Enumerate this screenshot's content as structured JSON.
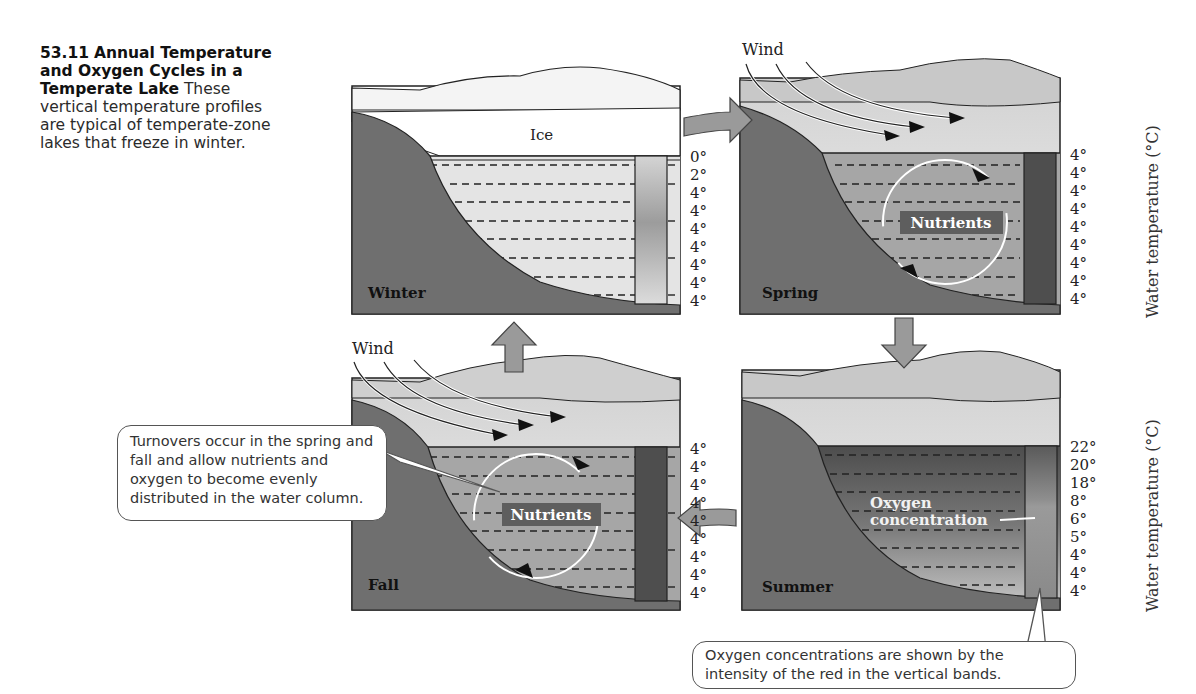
{
  "caption": {
    "figure_number": "53.11",
    "title": "Annual Temperature and Oxygen Cycles in a Temperate Lake",
    "body": "These vertical temperature profiles are typical of temperate-zone lakes that freeze in winter."
  },
  "panels": {
    "winter": {
      "label": "Winter",
      "surface_label": "Ice",
      "temperatures": [
        "0°",
        "2°",
        "4°",
        "4°",
        "4°",
        "4°",
        "4°",
        "4°",
        "4°"
      ]
    },
    "spring": {
      "label": "Spring",
      "wind_label": "Wind",
      "nutrients_label": "Nutrients",
      "temperatures": [
        "4°",
        "4°",
        "4°",
        "4°",
        "4°",
        "4°",
        "4°",
        "4°",
        "4°"
      ],
      "axis_label": "Water temperature (°C)"
    },
    "fall": {
      "label": "Fall",
      "wind_label": "Wind",
      "nutrients_label": "Nutrients",
      "temperatures": [
        "4°",
        "4°",
        "4°",
        "4°",
        "4°",
        "4°",
        "4°",
        "4°",
        "4°"
      ]
    },
    "summer": {
      "label": "Summer",
      "oxygen_label_line1": "Oxygen",
      "oxygen_label_line2": "concentration",
      "temperatures": [
        "22°",
        "20°",
        "18°",
        "8°",
        "6°",
        "5°",
        "4°",
        "4°",
        "4°"
      ],
      "axis_label": "Water temperature (°C)"
    }
  },
  "callouts": {
    "turnover": "Turnovers occur in the spring and fall and allow nutrients and oxygen to become evenly distributed in the water column.",
    "oxygen": "Oxygen concentrations are shown by the intensity of the red in the vertical bands."
  },
  "colors": {
    "ground": "#6f6f6f",
    "winter_water": "#e4e4e4",
    "turnover_water": "#a6a6a6",
    "oxygen_band_dark": "#4e4e4e",
    "cycle_arrow": "#9a9a9a"
  }
}
